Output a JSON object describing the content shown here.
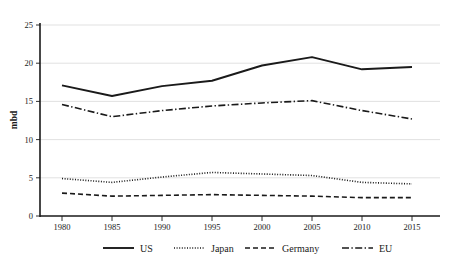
{
  "chart_data": {
    "type": "line",
    "title": "",
    "subtitle": "",
    "xlabel": "",
    "ylabel": "mbd",
    "x": [
      1980,
      1985,
      1990,
      1995,
      2000,
      2005,
      2010,
      2015
    ],
    "xticklabels": [
      "1980",
      "1985",
      "1990",
      "1995",
      "2000",
      "2005",
      "2010",
      "2015"
    ],
    "yticks": [
      0,
      5,
      10,
      15,
      20,
      25
    ],
    "yticklabels": [
      "0",
      "5",
      "10",
      "15",
      "20",
      "25"
    ],
    "ylim": [
      0,
      25
    ],
    "xlim": [
      1978,
      2018
    ],
    "grid": "horizontal",
    "legend_position": "bottom",
    "series": [
      {
        "name": "US",
        "linestyle": "solid",
        "color": "#1a1a1a",
        "values": [
          17.1,
          15.7,
          17.0,
          17.7,
          19.7,
          20.8,
          19.2,
          19.5
        ]
      },
      {
        "name": "Japan",
        "linestyle": "dotted",
        "color": "#1a1a1a",
        "values": [
          4.9,
          4.4,
          5.1,
          5.7,
          5.5,
          5.3,
          4.4,
          4.2
        ]
      },
      {
        "name": "Germany",
        "linestyle": "dashed",
        "color": "#1a1a1a",
        "values": [
          3.0,
          2.6,
          2.7,
          2.8,
          2.7,
          2.6,
          2.4,
          2.4
        ]
      },
      {
        "name": "EU",
        "linestyle": "dashdot",
        "color": "#1a1a1a",
        "values": [
          14.6,
          13.0,
          13.8,
          14.4,
          14.8,
          15.1,
          13.8,
          12.7
        ]
      }
    ]
  },
  "axes": {
    "ylabel": "mbd",
    "yticklabels": [
      "25",
      "20",
      "15",
      "10",
      "5",
      "0"
    ],
    "xticklabels": [
      "1980",
      "1985",
      "1990",
      "1995",
      "2000",
      "2005",
      "2010",
      "2015"
    ]
  },
  "legend": {
    "items": [
      {
        "label": "US"
      },
      {
        "label": "Japan"
      },
      {
        "label": "Germany"
      },
      {
        "label": "EU"
      }
    ]
  }
}
